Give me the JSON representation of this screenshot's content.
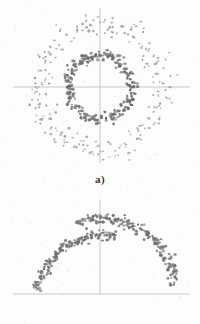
{
  "figure": {
    "title": "",
    "background_color": "#fdfdfd",
    "width": 200,
    "height": 324,
    "axis_color": "#b9b9b9",
    "point_color_dense": "#6e6e6e",
    "point_color_sparse": "#9a9a9a"
  },
  "panels": [
    {
      "id": "a",
      "caption": "a)",
      "axes": {
        "origin_x": 100,
        "origin_y": 87,
        "h_line": {
          "x1": 13,
          "x2": 190,
          "y": 87
        },
        "v_line": {
          "x": 100,
          "y1": 8,
          "y2": 163
        }
      }
    },
    {
      "id": "b",
      "caption": "b)",
      "axes": {
        "origin_x": 100,
        "origin_y": 104,
        "h_line": {
          "x1": 13,
          "x2": 190,
          "y": 104
        },
        "v_line": {
          "x": 100,
          "y1": 10,
          "y2": 104
        }
      }
    }
  ],
  "chart_data": [
    {
      "type": "scatter",
      "panel": "a",
      "title": "a)",
      "xlabel": "",
      "ylabel": "",
      "grid": false,
      "legend": "none",
      "xlim": [
        -100,
        100
      ],
      "ylim": [
        -87,
        87
      ],
      "description": "Two concentric noisy rings of scattered points centred on the axis crossing.",
      "series": [
        {
          "name": "inner-ring",
          "shape": "ring",
          "center": [
            100,
            87
          ],
          "radius": 32,
          "radial_jitter": 3.0,
          "n_points": 260,
          "color": "#6b6b6b",
          "marker_size": 1.35,
          "density": "dense"
        },
        {
          "name": "outer-ring",
          "shape": "ring",
          "center": [
            100,
            87
          ],
          "radius": 62,
          "radial_jitter": 6.0,
          "n_points": 300,
          "color": "#9c9c9c",
          "marker_size": 1.05,
          "density": "sparse"
        }
      ]
    },
    {
      "type": "scatter",
      "panel": "b",
      "title": "b)",
      "xlabel": "",
      "ylabel": "",
      "grid": false,
      "legend": "none",
      "xlim": [
        -100,
        100
      ],
      "ylim": [
        0,
        104
      ],
      "description": "Two overlapping noisy arc segments forming an open dome above the baseline.",
      "series": [
        {
          "name": "arc-upper-right",
          "shape": "arc",
          "center": [
            100,
            104
          ],
          "radius": 76,
          "radial_jitter": 3.0,
          "angle_start_deg": 8,
          "angle_end_deg": 108,
          "n_points": 180,
          "color": "#707070",
          "marker_size": 1.3,
          "density": "dense"
        },
        {
          "name": "arc-left-flat",
          "shape": "arc",
          "center": [
            104,
            112
          ],
          "radius": 67,
          "radial_jitter": 2.6,
          "angle_start_deg": 80,
          "angle_end_deg": 170,
          "n_points": 165,
          "color": "#707070",
          "marker_size": 1.3,
          "density": "dense"
        }
      ]
    }
  ]
}
